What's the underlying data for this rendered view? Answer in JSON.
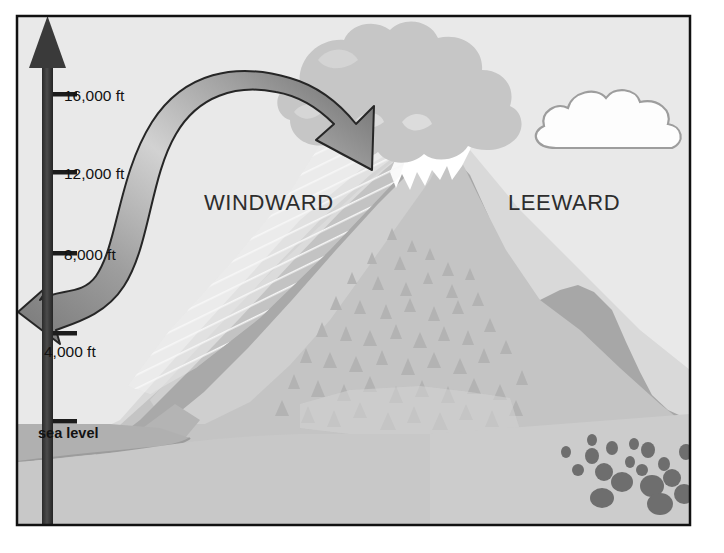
{
  "figure": {
    "type": "orographic-rain-shadow-diagram",
    "frame": {
      "border_color": "#111111",
      "border_width": 2,
      "background_color": "#e9e9e9"
    }
  },
  "axis": {
    "name": "altitude-axis",
    "orientation": "vertical",
    "arrow_color": "#3a3a3a",
    "ticks": [
      {
        "label": "16,000 ft",
        "y": 94
      },
      {
        "label": "12,000 ft",
        "y": 172
      },
      {
        "label": "8,000 ft",
        "y": 253
      },
      {
        "label": "4,000 ft",
        "y": 333
      },
      {
        "label": "sea level",
        "y": 421
      }
    ]
  },
  "labels": {
    "windward": "WINDWARD",
    "leeward": "LEEWARD"
  },
  "palette": {
    "sky": "#e9e9e9",
    "mountain_light": "#cfcfcf",
    "mountain_mid": "#bdbdbd",
    "mountain_dark": "#a3a3a3",
    "mountain_shadow": "#9a9a9a",
    "snow": "#ffffff",
    "storm_cloud": "#c6c6c6",
    "fair_cloud": "#fdfdfd",
    "cloud_outline": "#9d9d9d",
    "tree": "#b0b0b0",
    "rock": "#6e6e6e",
    "water": "#b5b5b5",
    "arrow_light": "#d6d6d6",
    "arrow_dark": "#6f6f6f",
    "arrow_outline": "#262626",
    "rain": "#f2f2f2",
    "text": "#121212",
    "axis": "#3a3a3a"
  },
  "elements": {
    "storm_cloud": "gray cumulus storm cloud over the windward summit",
    "fair_cloud": "white fair-weather cloud on the leeward side",
    "snow_cap": "white snow cap on the mountain summit",
    "rain_band": "diagonal precipitation streaks on the windward slope",
    "forest": "conifer forest on the windward slope",
    "desert_scrub": "scattered scrub and rocks in the leeward rain shadow",
    "wind_arrow": "curved air-flow arrow rising up the windward slope",
    "sea": "ocean at the base of the windward side"
  }
}
